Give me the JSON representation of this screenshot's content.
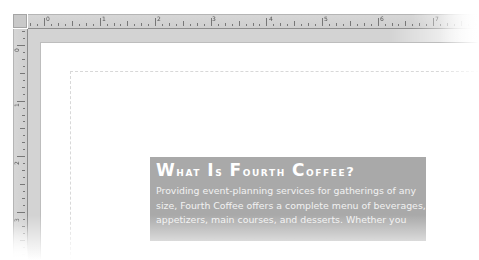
{
  "window": {
    "app": "Publisher document canvas"
  },
  "rulers": {
    "horizontal": {
      "labels": [
        "0",
        "1",
        "2",
        "3",
        "4",
        "5",
        "6",
        "7"
      ],
      "label_positions_px": [
        44,
        100,
        155,
        210,
        267,
        322,
        378,
        433
      ]
    },
    "vertical": {
      "labels": [
        "0",
        "1",
        "2",
        "3"
      ],
      "label_positions_px": [
        45,
        100,
        158,
        215
      ]
    }
  },
  "textbox": {
    "heading": "What Is Fourth Coffee?",
    "heading_words": [
      {
        "cap": "W",
        "rest": "hat"
      },
      {
        "cap": "I",
        "rest": "s"
      },
      {
        "cap": "F",
        "rest": "ourth"
      },
      {
        "cap": "C",
        "rest": "offee?"
      }
    ],
    "body_lines": [
      "Providing event-planning services for gatherings of any",
      "size, Fourth Coffee offers a complete menu of beverages,",
      "appetizers, main courses, and desserts. Whether you"
    ],
    "background_color": "#a9a9a9",
    "text_color": "#ffffff"
  },
  "colors": {
    "ruler": "#d3d3d3",
    "workspace": "#d3d3d3",
    "page": "#ffffff",
    "guide": "#d8d8d8"
  }
}
